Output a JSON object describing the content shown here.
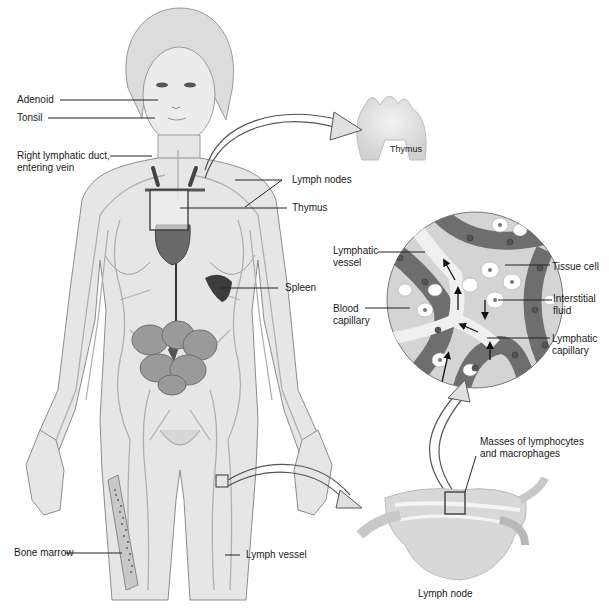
{
  "figure": {
    "colors": {
      "skin": "#e6e6e6",
      "outline": "#8c8c8c",
      "vessel": "#b8b8b8",
      "organ_dark": "#5a5a5a",
      "intestine": "#9a9a9a",
      "capillary_blood": "#6e6e6e",
      "lymph_vessel_fill": "#f2f2f2",
      "label_text": "#1a1a1a",
      "leader_line": "#222222"
    }
  },
  "labels": {
    "adenoid": "Adenoid",
    "tonsil": "Tonsil",
    "right_lymphatic_duct_line1": "Right lymphatic duct,",
    "right_lymphatic_duct_line2": "entering vein",
    "lymph_nodes": "Lymph nodes",
    "thymus_body": "Thymus",
    "spleen": "Spleen",
    "bone_marrow": "Bone marrow",
    "lymph_vessel": "Lymph vessel",
    "thymus_inset": "Thymus",
    "lymphatic_vessel_line1": "Lymphatic",
    "lymphatic_vessel_line2": "vessel",
    "blood_capillary_line1": "Blood",
    "blood_capillary_line2": "capillary",
    "tissue_cell": "Tissue cell",
    "interstitial_fluid_line1": "Interstitial",
    "interstitial_fluid_line2": "fluid",
    "lymphatic_capillary_line1": "Lymphatic",
    "lymphatic_capillary_line2": "capillary",
    "masses_line1": "Masses of lymphocytes",
    "masses_line2": "and macrophages",
    "lymph_node": "Lymph node"
  }
}
